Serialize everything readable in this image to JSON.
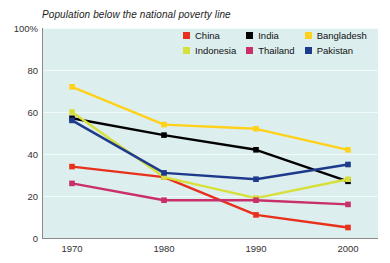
{
  "chart_data": {
    "type": "line",
    "title": "Population below the national poverty line",
    "xlabel": "",
    "ylabel": "",
    "x": [
      1970,
      1980,
      1990,
      2000
    ],
    "xticklabels": [
      "1970",
      "1980",
      "1990",
      "2000"
    ],
    "yticklabels": [
      "0",
      "20",
      "40",
      "60",
      "80",
      "100%"
    ],
    "yticks": [
      0,
      20,
      40,
      60,
      80,
      100
    ],
    "ylim": [
      0,
      100
    ],
    "grid": true,
    "legend_position": "top-right",
    "plot_background": "#dceeed",
    "series": [
      {
        "name": "China",
        "color": "#e8301c",
        "values": [
          34,
          29,
          11,
          5
        ]
      },
      {
        "name": "India",
        "color": "#000000",
        "values": [
          57,
          49,
          42,
          27
        ]
      },
      {
        "name": "Bangladesh",
        "color": "#ffd11a",
        "values": [
          72,
          54,
          52,
          42
        ]
      },
      {
        "name": "Indonesia",
        "color": "#d7e03a",
        "values": [
          60,
          29,
          19,
          28
        ]
      },
      {
        "name": "Thailand",
        "color": "#c9306b",
        "values": [
          26,
          18,
          18,
          16
        ]
      },
      {
        "name": "Pakistan",
        "color": "#1e3a8c",
        "values": [
          56,
          31,
          28,
          35
        ]
      }
    ]
  },
  "legend": {
    "items": [
      {
        "label": "China",
        "color": "#e8301c"
      },
      {
        "label": "India",
        "color": "#000000"
      },
      {
        "label": "Bangladesh",
        "color": "#ffd11a"
      },
      {
        "label": "Indonesia",
        "color": "#d7e03a"
      },
      {
        "label": "Thailand",
        "color": "#c9306b"
      },
      {
        "label": "Pakistan",
        "color": "#1e3a8c"
      }
    ]
  }
}
